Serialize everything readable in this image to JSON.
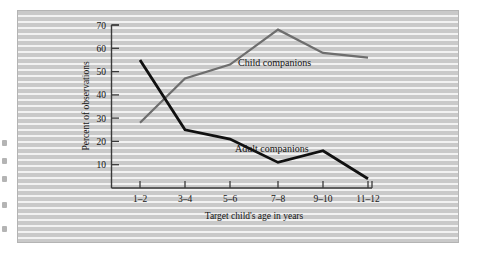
{
  "figure": {
    "background_color": "#c9c9c9",
    "frame_color": "#b4b4b4"
  },
  "chart_data": {
    "type": "line",
    "title": "",
    "xlabel": "Target child's age in years",
    "ylabel": "Percent of observations",
    "categories": [
      "1–2",
      "3–4",
      "5–6",
      "7–8",
      "9–10",
      "11–12"
    ],
    "ylim": [
      0,
      70
    ],
    "yticks": [
      10,
      20,
      30,
      40,
      50,
      60,
      70
    ],
    "ytick_labels": [
      "10",
      "20",
      "30",
      "40",
      "50",
      "60",
      "70"
    ],
    "grid": false,
    "legend_position": "inline-annotation",
    "series": [
      {
        "name": "Child companions",
        "color": "#6e6e6e",
        "values": [
          28,
          47,
          53,
          68,
          58,
          56
        ],
        "annotation": "Child companions"
      },
      {
        "name": "Adult companions",
        "color": "#111111",
        "values": [
          55,
          25,
          21,
          11,
          16,
          4
        ],
        "annotation": "Adult companions"
      }
    ]
  },
  "annotations": {
    "child_label": "Child companions",
    "adult_label": "Adult companions"
  }
}
